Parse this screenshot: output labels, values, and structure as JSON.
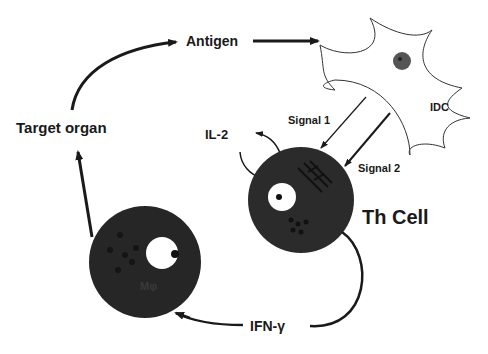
{
  "diagram": {
    "nodes": {
      "antigen": "Antigen",
      "target_organ": "Target organ",
      "idc": "IDC",
      "th_cell": "Th Cell",
      "macrophage": "Mφ"
    },
    "edges": {
      "signal1": "Signal 1",
      "signal2": "Signal 2",
      "il2": "IL-2",
      "ifn_gamma": "IFN-γ"
    }
  }
}
